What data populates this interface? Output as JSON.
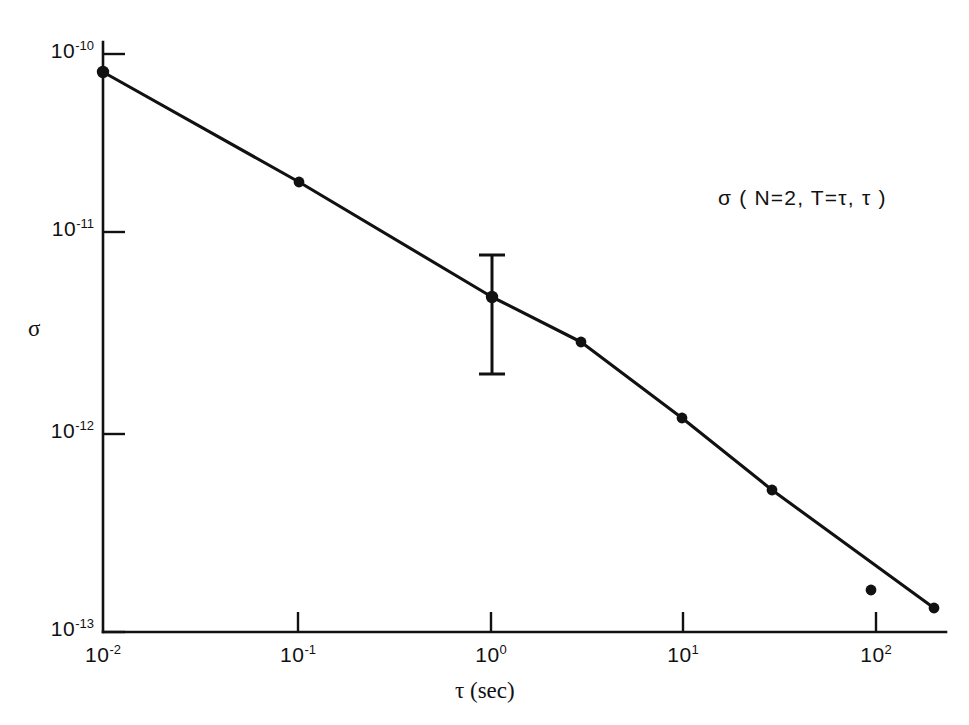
{
  "figure": {
    "background_color": "#ffffff",
    "ink_color": "#111111",
    "annotation": "σ ( N=2, T=τ, τ )"
  },
  "axes": {
    "x_title": "τ (sec)",
    "y_title": "σ",
    "x_ticks": [
      {
        "mantissa": "10",
        "exponent": "-2",
        "value": 0.01,
        "px": 103
      },
      {
        "mantissa": "10",
        "exponent": "-1",
        "value": 0.1,
        "px": 298
      },
      {
        "mantissa": "10",
        "exponent": "0",
        "value": 1,
        "px": 491
      },
      {
        "mantissa": "10",
        "exponent": "1",
        "value": 10,
        "px": 683
      },
      {
        "mantissa": "10",
        "exponent": "2",
        "value": 100,
        "px": 876
      }
    ],
    "y_ticks": [
      {
        "mantissa": "10",
        "exponent": "-10",
        "value": 1e-10,
        "px": 54
      },
      {
        "mantissa": "10",
        "exponent": "-11",
        "value": 1e-11,
        "px": 232
      },
      {
        "mantissa": "10",
        "exponent": "-12",
        "value": 1e-12,
        "px": 434
      },
      {
        "mantissa": "10",
        "exponent": "-13",
        "value": 1e-13,
        "px": 632
      }
    ]
  },
  "chart_data": {
    "type": "line",
    "title": "",
    "subtitle": "",
    "xlabel": "τ (sec)",
    "ylabel": "σ",
    "xscale": "log",
    "yscale": "log",
    "xlim": [
      0.008,
      230
    ],
    "ylim": [
      9e-14,
      1.15e-10
    ],
    "grid": false,
    "legend": null,
    "annotations": [
      {
        "text": "σ ( N=2, T=τ, τ )",
        "x": 18,
        "y": 2.2e-11
      }
    ],
    "series": [
      {
        "name": "σ ( N=2, T=τ, τ )",
        "marker": "filled-circle",
        "line": "solid",
        "x": [
          0.0085,
          0.1,
          1.0,
          3.2,
          10.0,
          32.0,
          200.0
        ],
        "y": [
          7.8e-11,
          2.05e-11,
          5.2e-12,
          3e-12,
          1.25e-12,
          5.2e-13,
          1.35e-13
        ]
      },
      {
        "name": "outlier-point",
        "marker": "filled-circle",
        "line": "none",
        "x": [
          100.0
        ],
        "y": [
          1.68e-13
        ]
      }
    ],
    "error_bars": [
      {
        "x": 1.0,
        "y": 5.2e-12,
        "y_upper": 1e-11,
        "y_lower": 2.2e-12
      }
    ]
  },
  "geometry": {
    "plot_left_px": 103,
    "plot_bottom_px": 632,
    "plot_right_px": 946,
    "plot_top_px": 42,
    "points_px": [
      {
        "x": 103,
        "y": 72
      },
      {
        "x": 299,
        "y": 182
      },
      {
        "x": 492,
        "y": 297
      },
      {
        "x": 581,
        "y": 342
      },
      {
        "x": 682,
        "y": 418
      },
      {
        "x": 772,
        "y": 490
      },
      {
        "x": 934,
        "y": 608
      }
    ],
    "outlier_px": {
      "x": 871,
      "y": 590
    },
    "error_bar_px": {
      "x": 492,
      "top": 255,
      "bottom": 374,
      "cap_half_width": 13
    }
  }
}
